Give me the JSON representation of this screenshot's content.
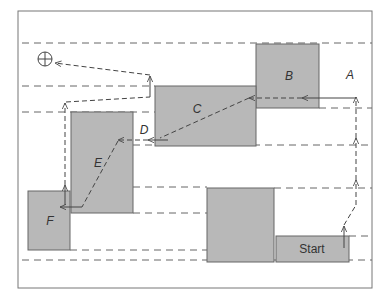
{
  "diagram": {
    "type": "skyline-placement",
    "colors": {
      "block_fill": "#b8b8b8",
      "block_stroke": "#666666",
      "frame": "#666666",
      "dashed": "#555555",
      "arrow": "#444444"
    },
    "blocks": [
      {
        "id": "start",
        "label": "Start",
        "italic": false,
        "x": 276,
        "y": 236,
        "w": 73,
        "h": 26
      },
      {
        "id": "unlabeled",
        "label": "",
        "x": 207,
        "y": 188,
        "w": 67,
        "h": 74
      },
      {
        "id": "A",
        "label": "A",
        "x": 0,
        "y": 0,
        "w": 0,
        "h": 0,
        "text_only": true,
        "tx": 345,
        "ty": 78
      },
      {
        "id": "B",
        "label": "B",
        "x": 256,
        "y": 44,
        "w": 63,
        "h": 64
      },
      {
        "id": "C",
        "label": "C",
        "x": 155,
        "y": 86,
        "w": 101,
        "h": 60
      },
      {
        "id": "D",
        "label": "D",
        "text_only": true,
        "tx": 142,
        "ty": 135
      },
      {
        "id": "E",
        "label": "E",
        "x": 71,
        "y": 112,
        "w": 62,
        "h": 101
      },
      {
        "id": "F",
        "label": "F",
        "x": 28,
        "y": 191,
        "w": 42,
        "h": 59
      }
    ],
    "goal_symbol": "⊕"
  }
}
